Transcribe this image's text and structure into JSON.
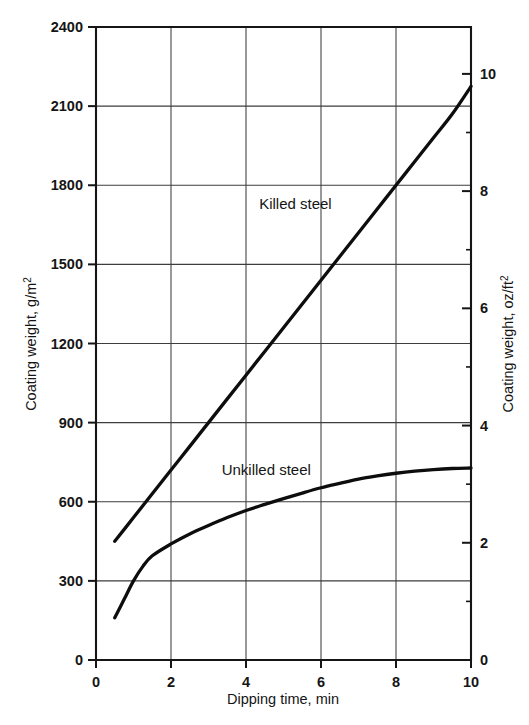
{
  "chart_data": {
    "type": "line",
    "title": "",
    "xlabel": "Dipping time, min",
    "ylabel": "Coating weight, g/m²",
    "ylabel_right": "Coating weight, oz/ft²",
    "xlim": [
      0,
      10
    ],
    "ylim": [
      0,
      2400
    ],
    "ylim_right": [
      0,
      10.8
    ],
    "xticks": [
      0,
      2,
      4,
      6,
      8,
      10
    ],
    "xtick_labels": [
      "0",
      "2",
      "4",
      "6",
      "8",
      "10"
    ],
    "yticks": [
      0,
      300,
      600,
      900,
      1200,
      1500,
      1800,
      2100,
      2400
    ],
    "ytick_labels": [
      "0",
      "300",
      "600",
      "900",
      "1200",
      "1500",
      "1800",
      "2100",
      "2400"
    ],
    "yticks_right": [
      0,
      2,
      4,
      6,
      8,
      10
    ],
    "ytick_labels_right": [
      "0",
      "2",
      "4",
      "6",
      "8",
      "10"
    ],
    "yticks_right_minor": [
      1,
      3,
      5,
      7,
      9
    ],
    "grid": true,
    "grid_axis": "both",
    "legend": "inline-annotation",
    "series": [
      {
        "name": "Killed steel",
        "label": "Killed steel",
        "label_x": 4.35,
        "label_y": 1710,
        "x": [
          0.5,
          1,
          1.5,
          2,
          2.5,
          3,
          3.5,
          4,
          4.5,
          5,
          5.5,
          6,
          6.5,
          7,
          7.5,
          8,
          8.5,
          9,
          9.5,
          10
        ],
        "y": [
          450,
          540,
          630,
          720,
          810,
          900,
          990,
          1080,
          1170,
          1260,
          1350,
          1440,
          1530,
          1620,
          1710,
          1800,
          1890,
          1980,
          2070,
          2175
        ]
      },
      {
        "name": "Unkilled steel",
        "label": "Unkilled steel",
        "label_x": 3.35,
        "label_y": 700,
        "x": [
          0.5,
          0.75,
          1,
          1.25,
          1.5,
          2,
          2.5,
          3,
          3.5,
          4,
          4.5,
          5,
          5.5,
          6,
          6.5,
          7,
          7.5,
          8,
          8.5,
          9,
          9.5,
          10
        ],
        "y": [
          160,
          230,
          300,
          355,
          395,
          440,
          478,
          510,
          540,
          567,
          590,
          612,
          633,
          653,
          670,
          686,
          698,
          708,
          716,
          722,
          726,
          728
        ]
      }
    ]
  },
  "axis": {
    "x_title": "Dipping time, min",
    "y_title_left_pre": "Coating weight, g/m",
    "y_title_left_sup": "2",
    "y_title_right_pre": "Coating weight, oz/ft",
    "y_title_right_sup": "2"
  }
}
